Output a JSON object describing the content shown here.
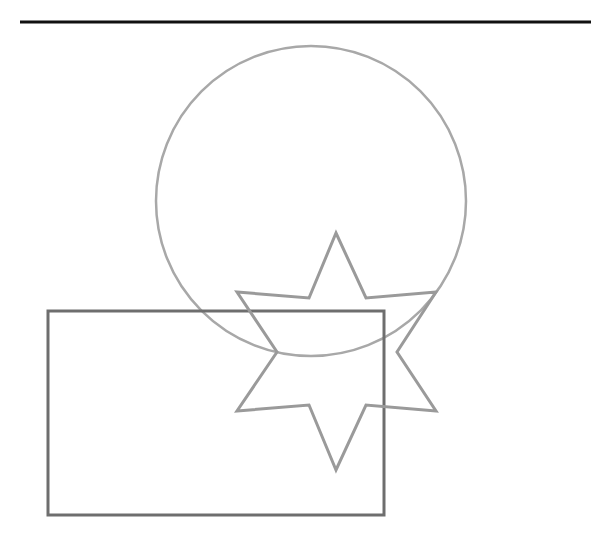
{
  "canvas": {
    "width": 591,
    "height": 538,
    "background": "#ffffff"
  },
  "shapes": {
    "top_rule": {
      "type": "line",
      "x1": 20,
      "y1": 22,
      "x2": 591,
      "y2": 22,
      "stroke": "#111111",
      "stroke_width": 3
    },
    "circle": {
      "type": "circle",
      "cx": 311,
      "cy": 201,
      "r": 155,
      "stroke": "#a8a8a8",
      "stroke_width": 2.5
    },
    "star": {
      "type": "six-pointed-star",
      "points": "336,233 366,298 436,292 397,352 436,411 366,405 336,470 309,405 237,411 277,352 237,292 309,298",
      "stroke": "#9a9a9a",
      "stroke_width": 3
    },
    "rectangle": {
      "type": "rectangle",
      "x": 48,
      "y": 311,
      "width": 336,
      "height": 204,
      "stroke": "#6e6e6e",
      "stroke_width": 3
    }
  }
}
